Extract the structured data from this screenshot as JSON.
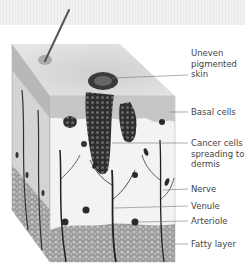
{
  "diagram": {
    "style": "grayscale medical illustration",
    "colors": {
      "background": "#ffffff",
      "top_band": "#ececec",
      "epidermis": "#c8c8c8",
      "dermis": "#f2f2f2",
      "cancer_cells": "#3a3a3a",
      "fatty_layer": "#8a8a8a",
      "label_text": "#444444",
      "leader_line": "#777777"
    },
    "labels": [
      {
        "id": "uneven-pigmented-skin",
        "text": "Uneven\npigmented\nskin"
      },
      {
        "id": "basal-cells",
        "text": "Basal cells"
      },
      {
        "id": "cancer-cells",
        "text": "Cancer cells\nspreading to\ndermis"
      },
      {
        "id": "nerve",
        "text": "Nerve"
      },
      {
        "id": "venule",
        "text": "Venule"
      },
      {
        "id": "arteriole",
        "text": "Arteriole"
      },
      {
        "id": "fatty-layer",
        "text": "Fatty layer"
      }
    ]
  }
}
